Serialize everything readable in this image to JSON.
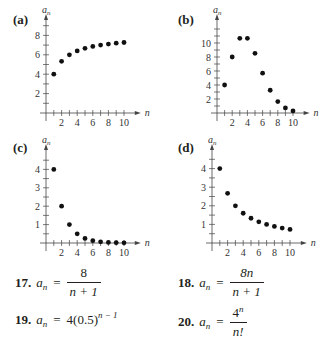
{
  "chart_data": [
    {
      "id": "a",
      "label": "(a)",
      "type": "scatter",
      "title": "",
      "xlabel": "n",
      "ylabel": "a_n",
      "x": [
        1,
        2,
        3,
        4,
        5,
        6,
        7,
        8,
        9,
        10
      ],
      "values": [
        4,
        5.33,
        6,
        6.4,
        6.67,
        6.86,
        7,
        7.11,
        7.2,
        7.27
      ],
      "xticks": [
        2,
        4,
        6,
        8,
        10
      ],
      "yticks": [
        2,
        4,
        6,
        8
      ],
      "xlim": [
        0,
        10.5
      ],
      "ylim": [
        0,
        9
      ],
      "grid": false
    },
    {
      "id": "b",
      "label": "(b)",
      "type": "scatter",
      "title": "",
      "xlabel": "n",
      "ylabel": "a_n",
      "x": [
        1,
        2,
        3,
        4,
        5,
        6,
        7,
        8,
        9,
        10
      ],
      "values": [
        4,
        8,
        10.67,
        10.67,
        8.53,
        5.69,
        3.25,
        1.63,
        0.72,
        0.29
      ],
      "xticks": [
        2,
        4,
        6,
        8,
        10
      ],
      "yticks": [
        2,
        4,
        6,
        8,
        10
      ],
      "xlim": [
        0,
        10.5
      ],
      "ylim": [
        0,
        12
      ],
      "grid": false
    },
    {
      "id": "c",
      "label": "(c)",
      "type": "scatter",
      "title": "",
      "xlabel": "n",
      "ylabel": "a_n",
      "x": [
        1,
        2,
        3,
        4,
        5,
        6,
        7,
        8,
        9,
        10
      ],
      "values": [
        4,
        2,
        1,
        0.5,
        0.25,
        0.125,
        0.0625,
        0.03125,
        0.0156,
        0.0078
      ],
      "xticks": [
        2,
        4,
        6,
        8,
        10
      ],
      "yticks": [
        1,
        2,
        3,
        4
      ],
      "xlim": [
        0,
        10.5
      ],
      "ylim": [
        0,
        4.5
      ],
      "grid": false
    },
    {
      "id": "d",
      "label": "(d)",
      "type": "scatter",
      "title": "",
      "xlabel": "n",
      "ylabel": "a_n",
      "x": [
        1,
        2,
        3,
        4,
        5,
        6,
        7,
        8,
        9,
        10
      ],
      "values": [
        4,
        2.67,
        2,
        1.6,
        1.33,
        1.14,
        1,
        0.89,
        0.8,
        0.73
      ],
      "xticks": [
        2,
        4,
        6,
        8,
        10
      ],
      "yticks": [
        1,
        2,
        3,
        4
      ],
      "xlim": [
        0,
        10.5
      ],
      "ylim": [
        0,
        4.5
      ],
      "grid": false
    }
  ],
  "exercises": [
    {
      "number": "17.",
      "lhs": "a",
      "sub": "n",
      "eq": "=",
      "numerator": "8",
      "denominator": "n + 1"
    },
    {
      "number": "18.",
      "lhs": "a",
      "sub": "n",
      "eq": "=",
      "numerator": "8n",
      "denominator": "n + 1"
    },
    {
      "number": "19.",
      "lhs": "a",
      "sub": "n",
      "eq": "=",
      "base": "4(0.5)",
      "exponent": "n − 1"
    },
    {
      "number": "20.",
      "lhs": "a",
      "sub": "n",
      "eq": "=",
      "numerator": "4",
      "numerator_exp": "n",
      "denominator": "n!"
    }
  ]
}
